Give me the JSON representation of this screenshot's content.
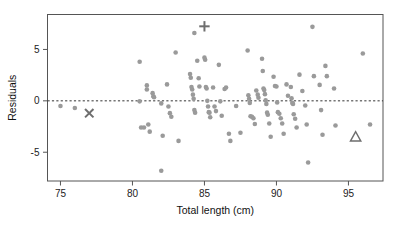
{
  "chart_data": {
    "type": "scatter",
    "title": "",
    "xlabel": "Total length (cm)",
    "ylabel": "Residuals",
    "xlim": [
      74.1,
      97.4
    ],
    "ylim": [
      -7.8,
      8.4
    ],
    "xticks": [
      75,
      80,
      85,
      90,
      95
    ],
    "xticklabels": [
      "75",
      "80",
      "85",
      "90",
      "95"
    ],
    "yticks": [
      5,
      0,
      -5
    ],
    "yticklabels": [
      "5",
      "0",
      "-5"
    ],
    "grid": false,
    "legend": false,
    "point_color": "#9a9a9a",
    "marker_color": "#6e6e6e",
    "axis_color": "#555555",
    "reference_line": {
      "y": 0,
      "style": "dashed",
      "color": "#333333"
    },
    "series": [
      {
        "name": "residuals",
        "marker": "circle",
        "points": [
          [
            75.0,
            -0.5
          ],
          [
            76.0,
            -0.7
          ],
          [
            80.5,
            3.8
          ],
          [
            80.5,
            -0.05
          ],
          [
            80.6,
            -2.6
          ],
          [
            80.8,
            -2.6
          ],
          [
            81.0,
            1.5
          ],
          [
            81.0,
            1.1
          ],
          [
            81.1,
            -2.3
          ],
          [
            81.2,
            -3.0
          ],
          [
            81.4,
            0.75
          ],
          [
            81.45,
            0.45
          ],
          [
            81.5,
            0.35
          ],
          [
            82.0,
            -0.25
          ],
          [
            82.0,
            -6.8
          ],
          [
            82.1,
            -3.4
          ],
          [
            82.4,
            1.6
          ],
          [
            82.5,
            -0.55
          ],
          [
            82.6,
            -1.2
          ],
          [
            82.7,
            -1.55
          ],
          [
            83.0,
            4.7
          ],
          [
            83.2,
            -3.9
          ],
          [
            84.0,
            2.6
          ],
          [
            84.05,
            2.25
          ],
          [
            84.1,
            1.35
          ],
          [
            84.15,
            1.1
          ],
          [
            84.2,
            0.6
          ],
          [
            84.25,
            0.2
          ],
          [
            84.3,
            6.6
          ],
          [
            84.3,
            -0.9
          ],
          [
            84.35,
            -1.15
          ],
          [
            84.5,
            3.9
          ],
          [
            84.6,
            2.2
          ],
          [
            84.65,
            1.4
          ],
          [
            85.0,
            4.2
          ],
          [
            85.05,
            4.0
          ],
          [
            85.1,
            1.35
          ],
          [
            85.15,
            1.2
          ],
          [
            85.2,
            0.0
          ],
          [
            85.25,
            -0.55
          ],
          [
            85.3,
            -1.1
          ],
          [
            85.35,
            -1.15
          ],
          [
            85.4,
            -1.6
          ],
          [
            85.6,
            1.3
          ],
          [
            85.7,
            -0.55
          ],
          [
            85.8,
            -1.0
          ],
          [
            86.0,
            3.5
          ],
          [
            86.1,
            -0.05
          ],
          [
            86.2,
            -1.45
          ],
          [
            86.4,
            1.15
          ],
          [
            86.5,
            1.3
          ],
          [
            86.7,
            -3.2
          ],
          [
            86.8,
            -3.9
          ],
          [
            87.2,
            -0.5
          ],
          [
            87.5,
            -3.1
          ],
          [
            88.0,
            4.9
          ],
          [
            88.05,
            0.55
          ],
          [
            88.1,
            0.2
          ],
          [
            88.15,
            -0.2
          ],
          [
            88.2,
            -1.5
          ],
          [
            88.3,
            -1.55
          ],
          [
            88.4,
            -1.7
          ],
          [
            88.5,
            -2.25
          ],
          [
            88.6,
            1.0
          ],
          [
            88.7,
            0.6
          ],
          [
            88.75,
            0.3
          ],
          [
            89.0,
            4.1
          ],
          [
            89.05,
            2.9
          ],
          [
            89.1,
            1.2
          ],
          [
            89.15,
            1.05
          ],
          [
            89.2,
            0.65
          ],
          [
            89.25,
            0.05
          ],
          [
            89.3,
            -0.3
          ],
          [
            89.35,
            -1.15
          ],
          [
            89.4,
            -1.35
          ],
          [
            89.5,
            -2.2
          ],
          [
            89.6,
            -3.5
          ],
          [
            89.8,
            2.35
          ],
          [
            89.9,
            1.45
          ],
          [
            90.0,
            1.4
          ],
          [
            90.05,
            -0.15
          ],
          [
            90.1,
            -1.1
          ],
          [
            90.2,
            -1.25
          ],
          [
            90.3,
            -1.7
          ],
          [
            90.4,
            -2.2
          ],
          [
            90.5,
            -3.2
          ],
          [
            90.7,
            1.6
          ],
          [
            90.8,
            0.5
          ],
          [
            91.0,
            1.35
          ],
          [
            91.05,
            0.25
          ],
          [
            91.1,
            -0.2
          ],
          [
            91.15,
            -0.3
          ],
          [
            91.2,
            -1.3
          ],
          [
            91.3,
            -1.75
          ],
          [
            91.4,
            -2.6
          ],
          [
            91.6,
            2.55
          ],
          [
            91.8,
            0.95
          ],
          [
            92.0,
            -0.45
          ],
          [
            92.1,
            -2.3
          ],
          [
            92.2,
            -6.0
          ],
          [
            92.5,
            7.2
          ],
          [
            92.6,
            2.4
          ],
          [
            93.0,
            1.55
          ],
          [
            93.1,
            -0.9
          ],
          [
            93.2,
            -3.3
          ],
          [
            93.4,
            3.4
          ],
          [
            93.5,
            2.4
          ],
          [
            94.0,
            1.2
          ],
          [
            94.1,
            -2.4
          ],
          [
            96.0,
            4.6
          ],
          [
            96.5,
            -2.3
          ]
        ]
      },
      {
        "name": "highlighted-cross",
        "marker": "x",
        "points": [
          [
            77.0,
            -1.2
          ]
        ]
      },
      {
        "name": "highlighted-plus",
        "marker": "plus",
        "points": [
          [
            85.0,
            7.25
          ]
        ]
      },
      {
        "name": "highlighted-triangle",
        "marker": "triangle",
        "points": [
          [
            95.5,
            -3.5
          ]
        ]
      }
    ]
  },
  "axes": {
    "x_title": "Total length (cm)",
    "y_title": "Residuals"
  }
}
